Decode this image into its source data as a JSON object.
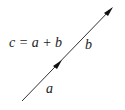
{
  "diagram": {
    "equation": "c = a + b",
    "vectors": [
      {
        "name": "a",
        "label": "a"
      },
      {
        "name": "b",
        "label": "b"
      }
    ],
    "colors": {
      "line": "#222222",
      "text": "#222222",
      "background": "#ffffff"
    }
  }
}
